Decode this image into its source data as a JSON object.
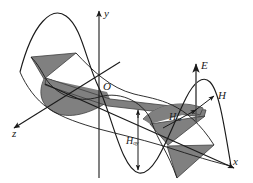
{
  "figure": {
    "background_color": "#ffffff",
    "curve_color": "#1a1a1a",
    "shade_color": "#808080",
    "shade_edge_color": "#4a4a4a"
  },
  "axes": {
    "y": {
      "label": "y",
      "icon": "arrow-up-icon"
    },
    "x": {
      "label": "x",
      "icon": "arrow-down-right-icon"
    },
    "z": {
      "label": "z",
      "icon": "arrow-down-left-icon"
    }
  },
  "origin": {
    "label": "O"
  },
  "vectors": {
    "e_field": {
      "label": "E",
      "icon": "arrow-up-icon"
    },
    "h_field": {
      "label": "H",
      "icon": "arrow-up-right-icon"
    }
  },
  "amplitudes": {
    "h_oy": {
      "symbol": "H",
      "subscript": "oy",
      "icon": "arrow-down-icon"
    },
    "h_oz": {
      "symbol": "H",
      "subscript": "oz",
      "icon": "arrow-up-right-icon"
    }
  }
}
